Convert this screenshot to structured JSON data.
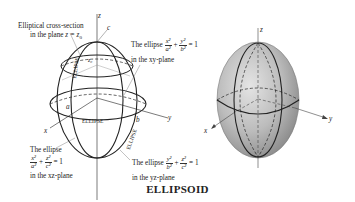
{
  "title": "ELLIPSOID",
  "left_diagram": {
    "cross_section_label": {
      "line1": "Elliptical cross-section",
      "line2_prefix": "in the plane ",
      "line2_eq": "z = z",
      "line2_sub": "0"
    },
    "xy_label": {
      "prefix": "The ellipse",
      "frac1_num": "x²",
      "frac1_den": "a²",
      "plus": "+",
      "frac2_num": "y²",
      "frac2_den": "b²",
      "rhs": "= 1",
      "line2": "in the xy-plane"
    },
    "xz_label": {
      "line1": "The ellipse",
      "frac1_num": "x²",
      "frac1_den": "a²",
      "plus": "+",
      "frac2_num": "z²",
      "frac2_den": "c²",
      "rhs": "= 1",
      "line3": "in the xz-plane"
    },
    "yz_label": {
      "prefix": "The ellipse",
      "frac1_num": "y²",
      "frac1_den": "b²",
      "plus": "+",
      "frac2_num": "z²",
      "frac2_den": "c²",
      "rhs": "= 1",
      "line2": "in the yz-plane"
    },
    "axis_labels": {
      "x": "x",
      "y": "y",
      "z": "z"
    },
    "semi_axis_labels": {
      "a": "a",
      "b": "b",
      "c": "c",
      "z0": "z₀"
    },
    "curve_labels": [
      "ELLIPSE",
      "ELLIPSE",
      "ELLIPSE"
    ]
  },
  "right_diagram": {
    "axis_labels": {
      "x": "x",
      "y": "y",
      "z": "z"
    },
    "fill_color": "#b8b8b8"
  }
}
